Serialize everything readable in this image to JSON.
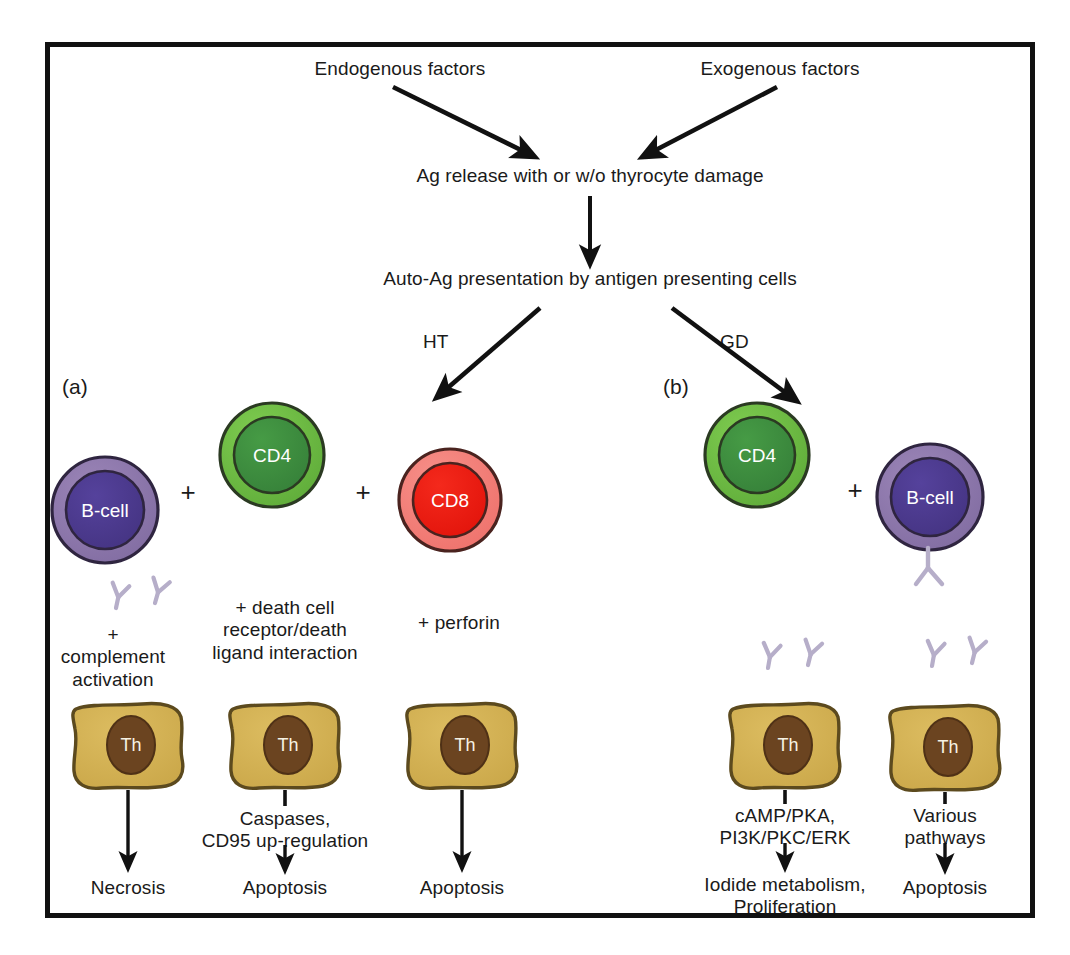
{
  "figure": {
    "title_top_left": "Endogenous factors",
    "title_top_right": "Exogenous factors",
    "step_release": "Ag release with or w/o thyrocyte damage",
    "step_presentation": "Auto-Ag presentation by antigen presenting cells",
    "branch_left_label": "HT",
    "branch_right_label": "GD",
    "panel_a_tag": "(a)",
    "panel_b_tag": "(b)",
    "plus_sign": "+"
  },
  "colors": {
    "frame": "#111111",
    "bcell_outer": "#8d77ab",
    "bcell_inner": "#4b3a8f",
    "cd4_outer": "#6fbe44",
    "cd4_inner": "#3f8f3f",
    "cd8_outer": "#f4827c",
    "cd8_inner": "#ee1c13",
    "thyrocyte_body": "#d4b254",
    "thyrocyte_nucleus": "#6b4420",
    "antibody": "#b6aec9",
    "arrow": "#111111",
    "text": "#1a1a1a"
  },
  "panel_a": {
    "cells": [
      {
        "name": "B-cell",
        "type": "bcell"
      },
      {
        "name": "CD4",
        "type": "cd4"
      },
      {
        "name": "CD8",
        "type": "cd8"
      }
    ],
    "mechanisms": [
      "+\ncomplement\nactivation",
      "+ death cell\nreceptor/death\nligand interaction",
      "+ perforin"
    ],
    "thyrocyte_label": "Th",
    "intermediates": [
      "",
      "Caspases,\nCD95 up-regulation",
      ""
    ],
    "outcomes": [
      "Necrosis",
      "Apoptosis",
      "Apoptosis"
    ]
  },
  "panel_b": {
    "cells": [
      {
        "name": "CD4",
        "type": "cd4"
      },
      {
        "name": "B-cell",
        "type": "bcell"
      }
    ],
    "thyrocyte_label": "Th",
    "intermediates": [
      "cAMP/PKA,\nPI3K/PKC/ERK",
      "Various\npathways"
    ],
    "outcomes": [
      "Iodide metabolism,\nProliferation",
      "Apoptosis"
    ]
  }
}
